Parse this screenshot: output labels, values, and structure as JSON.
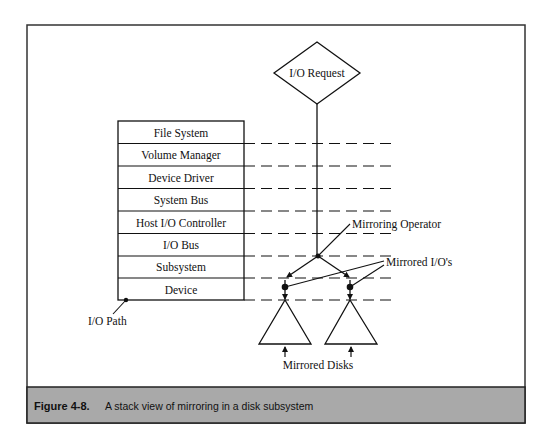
{
  "figure": {
    "label": "Figure 4-8.",
    "caption": "A stack view of mirroring in a disk subsystem",
    "caption_bg": "#a9a9a9"
  },
  "diagram": {
    "request_node": "I/O Request",
    "stack_layers": [
      "File System",
      "Volume Manager",
      "Device Driver",
      "System Bus",
      "Host I/O Controller",
      "I/O Bus",
      "Subsystem",
      "Device"
    ],
    "annotations": {
      "io_path": "I/O Path",
      "mirroring_operator": "Mirroring Operator",
      "mirrored_ios": "Mirrored I/O's",
      "mirrored_disks": "Mirrored Disks"
    }
  }
}
